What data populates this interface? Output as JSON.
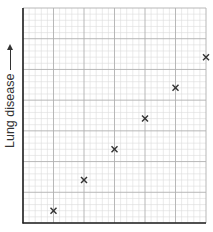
{
  "chart_data": {
    "type": "scatter",
    "title": "",
    "xlabel": "",
    "ylabel": "Lung disease",
    "ylabel_arrow": "up",
    "x_ticks": [],
    "y_ticks": [],
    "grid": {
      "on": true,
      "major_x_divisions": 6,
      "major_y_divisions": 7,
      "minor_per_major": 5
    },
    "xlim": [
      0,
      6
    ],
    "ylim": [
      0,
      7
    ],
    "marker": "x",
    "series": [
      {
        "name": "data",
        "x": [
          1,
          2,
          3,
          4,
          5,
          6
        ],
        "y": [
          0.4,
          1.4,
          2.4,
          3.4,
          4.4,
          5.4
        ]
      }
    ],
    "colors": {
      "marker": "#333333",
      "axis": "#222222",
      "major_grid": "#b0b0b0",
      "minor_grid": "#dcdcdc"
    }
  }
}
